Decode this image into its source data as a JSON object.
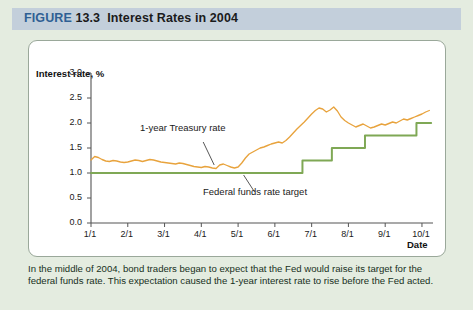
{
  "header": {
    "figure_word": "FIGURE",
    "figure_number": "13.3",
    "title": "Interest Rates in 2004"
  },
  "caption": "In the middle of 2004, bond traders began to expect that the Fed would raise its target for the federal funds rate. This expectation caused the 1-year interest rate to rise before the Fed acted.",
  "colors": {
    "header_band": "#c3cfdb",
    "figure_word": "#2f5f94",
    "page_background": "#e4ece0",
    "panel_background": "#ffffff",
    "treasury_line": "#e8a33d",
    "fedfunds_line": "#7fa855",
    "axis": "#555555"
  },
  "chart_data": {
    "type": "line",
    "title": "Interest Rates in 2004",
    "xlabel": "Date",
    "ylabel": "Interest rate, %",
    "ylim": [
      0.0,
      3.0
    ],
    "ytick_labels": [
      "0.0",
      "0.5",
      "1.0",
      "1.5",
      "2.0",
      "2.5",
      "3.0"
    ],
    "ytick_values": [
      0.0,
      0.5,
      1.0,
      1.5,
      2.0,
      2.5,
      3.0
    ],
    "xtick_labels": [
      "1/1",
      "2/1",
      "3/1",
      "4/1",
      "5/1",
      "6/1",
      "7/1",
      "8/1",
      "9/1",
      "10/1"
    ],
    "xtick_values": [
      1.0,
      2.0,
      3.0,
      4.0,
      5.0,
      6.0,
      7.0,
      8.0,
      9.0,
      10.0
    ],
    "xlim": [
      1.0,
      10.3
    ],
    "grid": false,
    "legend_position": "inline-annotations",
    "annotations": [
      {
        "text": "1-year Treasury rate",
        "series": "treasury"
      },
      {
        "text": "Federal funds rate target",
        "series": "fedfunds"
      }
    ],
    "series": [
      {
        "name": "1-year Treasury rate",
        "color": "#e8a33d",
        "x": [
          1.0,
          1.1,
          1.2,
          1.3,
          1.4,
          1.5,
          1.6,
          1.7,
          1.8,
          1.9,
          2.0,
          2.1,
          2.2,
          2.3,
          2.4,
          2.5,
          2.6,
          2.7,
          2.8,
          2.9,
          3.0,
          3.1,
          3.2,
          3.3,
          3.4,
          3.5,
          3.6,
          3.7,
          3.8,
          3.9,
          4.0,
          4.1,
          4.2,
          4.3,
          4.4,
          4.5,
          4.6,
          4.7,
          4.8,
          4.9,
          5.0,
          5.1,
          5.2,
          5.3,
          5.4,
          5.5,
          5.6,
          5.7,
          5.8,
          5.9,
          6.0,
          6.1,
          6.2,
          6.3,
          6.4,
          6.5,
          6.6,
          6.7,
          6.8,
          6.9,
          7.0,
          7.1,
          7.2,
          7.3,
          7.4,
          7.5,
          7.6,
          7.7,
          7.8,
          7.9,
          8.0,
          8.1,
          8.2,
          8.3,
          8.4,
          8.5,
          8.6,
          8.7,
          8.8,
          8.9,
          9.0,
          9.1,
          9.2,
          9.3,
          9.4,
          9.5,
          9.6,
          9.7,
          9.8,
          9.9,
          10.0,
          10.1,
          10.2
        ],
        "y": [
          1.26,
          1.33,
          1.31,
          1.27,
          1.24,
          1.23,
          1.25,
          1.24,
          1.22,
          1.21,
          1.22,
          1.24,
          1.26,
          1.25,
          1.23,
          1.25,
          1.27,
          1.26,
          1.24,
          1.22,
          1.21,
          1.2,
          1.19,
          1.18,
          1.2,
          1.19,
          1.17,
          1.15,
          1.13,
          1.12,
          1.11,
          1.13,
          1.12,
          1.1,
          1.09,
          1.16,
          1.18,
          1.15,
          1.12,
          1.1,
          1.12,
          1.2,
          1.3,
          1.38,
          1.42,
          1.46,
          1.5,
          1.52,
          1.55,
          1.58,
          1.6,
          1.62,
          1.6,
          1.65,
          1.72,
          1.8,
          1.88,
          1.95,
          2.02,
          2.1,
          2.18,
          2.25,
          2.3,
          2.28,
          2.22,
          2.26,
          2.32,
          2.24,
          2.12,
          2.05,
          2.0,
          1.96,
          1.92,
          1.95,
          1.98,
          1.94,
          1.9,
          1.92,
          1.95,
          1.98,
          1.96,
          1.99,
          2.02,
          2.0,
          2.04,
          2.08,
          2.06,
          2.09,
          2.12,
          2.15,
          2.18,
          2.22,
          2.25
        ]
      },
      {
        "name": "Federal funds rate target",
        "color": "#7fa855",
        "style": "step",
        "x": [
          1.0,
          6.75,
          6.75,
          7.55,
          7.55,
          8.45,
          8.45,
          9.85,
          9.85,
          10.25
        ],
        "y": [
          1.0,
          1.0,
          1.25,
          1.25,
          1.5,
          1.5,
          1.75,
          1.75,
          2.0,
          2.0
        ]
      }
    ]
  }
}
